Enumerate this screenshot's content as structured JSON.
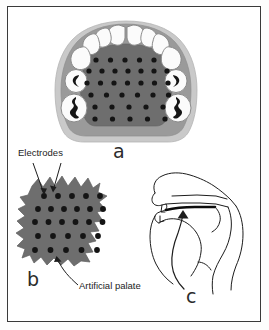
{
  "figure": {
    "background_color": "#ffffff",
    "border_color": "#3a3a3a",
    "width": 269,
    "height": 330
  },
  "colors": {
    "palate_dark_gray": "#6e6e6e",
    "palate_mid_gray": "#9a9a9a",
    "palate_light_gray": "#c9c9c9",
    "tooth_white": "#fbfbfb",
    "tooth_outline": "#8a8a8a",
    "electrode_black": "#141414",
    "line_black": "#1d1d1d",
    "text_black": "#1d1d1d"
  },
  "panels": [
    {
      "id": "a",
      "label": "a",
      "name": "occlusal-palate-view",
      "description": "Occlusal view of upper dental arch fitted with artificial palate carrying electrode grid"
    },
    {
      "id": "b",
      "label": "b",
      "name": "electrode-sheet-detail",
      "description": "Close-up of artificial palate sheet showing electrode array"
    },
    {
      "id": "c",
      "label": "c",
      "name": "midsagittal-head-view",
      "description": "Midsagittal section of head showing artificial palate in place against hard palate"
    }
  ],
  "annotations": {
    "electrodes_label": "Electrodes",
    "artificial_palate_label": "Artificial palate"
  },
  "panel_a": {
    "electrode_rows": [
      {
        "count": 5,
        "y": 60,
        "x_start": 96,
        "spacing": 14.5
      },
      {
        "count": 7,
        "y": 71,
        "x_start": 89,
        "spacing": 13.0
      },
      {
        "count": 7,
        "y": 83,
        "x_start": 87,
        "spacing": 13.5
      },
      {
        "count": 6,
        "y": 95,
        "x_start": 91,
        "spacing": 15.5
      },
      {
        "count": 5,
        "y": 107,
        "x_start": 95,
        "spacing": 17.0
      },
      {
        "count": 5,
        "y": 119,
        "x_start": 95,
        "spacing": 17.5
      }
    ],
    "teeth_count": 14
  },
  "panel_b": {
    "electrode_rows": [
      {
        "count": 5,
        "y": 196,
        "x_start": 44,
        "spacing": 14.0
      },
      {
        "count": 6,
        "y": 209,
        "x_start": 38,
        "spacing": 13.0
      },
      {
        "count": 6,
        "y": 222,
        "x_start": 35,
        "spacing": 13.5
      },
      {
        "count": 5,
        "y": 236,
        "x_start": 38,
        "spacing": 15.0
      },
      {
        "count": 5,
        "y": 250,
        "x_start": 35,
        "spacing": 15.5
      }
    ]
  }
}
